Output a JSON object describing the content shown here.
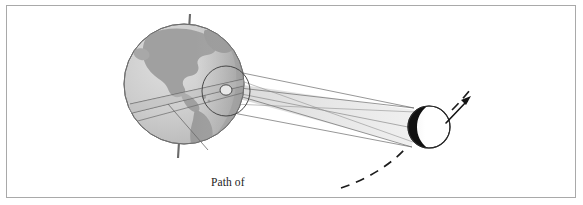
{
  "figure": {
    "domain": "Diagram",
    "topic": "annular solar eclipse geometry",
    "background_color": "#ffffff",
    "frame": {
      "name": "figure-border",
      "stroke": "#a9a9a9",
      "stroke_width": 1,
      "x": 6,
      "y": 5,
      "width": 570,
      "height": 193
    }
  },
  "labels": {
    "path_annular_line1": "Path of",
    "path_annular_line2": "annular eclipse"
  },
  "colors": {
    "ocean": "#c9c9c9",
    "ocean_light": "#d7d7d7",
    "land": "#a0a0a0",
    "land_dark": "#929292",
    "terminator": "#9a9a9a",
    "earth_outline": "#6e6e6e",
    "moon_fill": "#ffffff",
    "moon_shadow": "#101010",
    "moon_outline": "#2a2a2a",
    "ray_line": "#6a6a6a",
    "cone_fill": "#e3e3e3",
    "cone_fill_light": "#eeeeee",
    "axis_pole": "#6b6b6b",
    "leader_line": "#6a6a6a",
    "orbit_dash": "#1c1c1c",
    "arrow": "#141414",
    "text": "#1b1b1b"
  },
  "objects": {
    "earth": {
      "name": "earth-sphere",
      "center_x": 184,
      "center_y": 84,
      "radius": 60,
      "description": "Earth shown as shaded sphere with continents (North and South America)"
    },
    "axis": {
      "name": "earth-rotation-axis",
      "north_pole_x": 190,
      "north_pole_y": 14,
      "south_pole_x": 178,
      "south_pole_y": 158,
      "tilted": true
    },
    "penumbra_circle": {
      "name": "penumbra-circle",
      "center_x": 226,
      "center_y": 91,
      "radius_x": 24,
      "radius_y": 25
    },
    "antumbra_spot": {
      "name": "annular-eclipse-spot",
      "center_x": 226,
      "center_y": 91,
      "radius_x": 6,
      "radius_y": 5
    },
    "eclipse_path_band": {
      "name": "annular-eclipse-path-band",
      "description": "narrow band sweeping across Earth surface"
    },
    "moon": {
      "name": "moon-disk",
      "center_x": 429,
      "center_y": 127,
      "radius": 21,
      "shadow_side": "left",
      "description": "Moon with dark limb crescent facing away from viewer"
    },
    "shadow_cone": {
      "name": "shadow-cone",
      "description": "Converging cone of shadow lines from Moon toward Earth forming the antumbra"
    },
    "orbit_arrow": {
      "name": "moon-orbit-direction-arrow",
      "from_x": 446,
      "from_y": 122,
      "to_x": 470,
      "to_y": 98,
      "description": "arrow indicating the Moon's direction of travel"
    },
    "orbit_dashed": {
      "name": "moon-orbit-dashed-path",
      "description": "dashed curve tracing the Moon's orbital path"
    }
  }
}
